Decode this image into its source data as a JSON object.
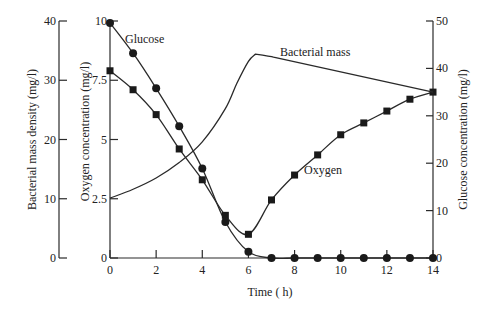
{
  "chart_data": {
    "type": "line",
    "title": "",
    "xlabel": "Time ( h)",
    "xlim": [
      0,
      14
    ],
    "x_ticks": [
      0,
      2,
      4,
      6,
      8,
      10,
      12,
      14
    ],
    "grid": false,
    "legend": "inline labels",
    "axes": {
      "bacterial": {
        "label": "Bacterial mass density (mg/l)",
        "ticks": [
          0,
          10,
          20,
          30,
          40
        ],
        "ylim": [
          0,
          40
        ],
        "position": "left-outer"
      },
      "oxygen": {
        "label": "Oxygen concentration (mg/l)",
        "ticks": [
          0,
          2.5,
          5,
          7.5,
          10
        ],
        "tick_labels": [
          "0",
          "2.5",
          "5",
          "7.5",
          "10"
        ],
        "ylim": [
          0,
          10
        ],
        "position": "left-inner"
      },
      "glucose": {
        "label": "Glucose concentration (mg/l)",
        "ticks": [
          0,
          10,
          20,
          30,
          40,
          50
        ],
        "ylim": [
          0,
          50
        ],
        "position": "right"
      }
    },
    "series": [
      {
        "name": "Glucose",
        "axis": "glucose",
        "marker": "circle",
        "x": [
          0,
          1,
          2,
          3,
          4,
          5,
          6,
          7,
          8,
          9,
          10,
          11,
          12,
          13,
          14
        ],
        "values": [
          49.6,
          43.2,
          35.8,
          27.8,
          18.9,
          7.6,
          1.3,
          0,
          0,
          0,
          0,
          0,
          0,
          0,
          0
        ]
      },
      {
        "name": "Oxygen",
        "axis": "oxygen",
        "marker": "square",
        "x": [
          0,
          1,
          2,
          3,
          4,
          5,
          6,
          7,
          8,
          9,
          10,
          11,
          12,
          13,
          14
        ],
        "values": [
          7.9,
          7.1,
          6.05,
          4.6,
          3.3,
          1.8,
          1.0,
          2.45,
          3.5,
          4.35,
          5.2,
          5.7,
          6.2,
          6.7,
          7.0
        ]
      },
      {
        "name": "Bacterial mass",
        "axis": "bacterial",
        "marker": "none",
        "x": [
          0,
          1,
          2,
          3,
          4,
          5,
          5.5,
          6,
          6.3,
          7,
          14
        ],
        "values": [
          10.1,
          11.6,
          13.5,
          16.1,
          19.6,
          25.2,
          29.5,
          33.2,
          34.4,
          34.0,
          28.0
        ]
      }
    ],
    "annotations": [
      "Glucose",
      "Bacterial mass",
      "Oxygen"
    ]
  }
}
